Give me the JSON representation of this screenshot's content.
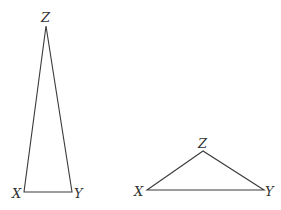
{
  "colors": {
    "stroke": "#3a3a3a",
    "label": "#333333",
    "background": "#ffffff"
  },
  "triangles": [
    {
      "id": "left",
      "vertices": {
        "Z": {
          "label": "Z",
          "x": 46,
          "y": 26
        },
        "X": {
          "label": "X",
          "x": 24,
          "y": 192
        },
        "Y": {
          "label": "Y",
          "x": 72,
          "y": 192
        }
      }
    },
    {
      "id": "right",
      "vertices": {
        "Z": {
          "label": "Z",
          "x": 203,
          "y": 151
        },
        "X": {
          "label": "X",
          "x": 147,
          "y": 190
        },
        "Y": {
          "label": "Y",
          "x": 264,
          "y": 190
        }
      }
    }
  ]
}
